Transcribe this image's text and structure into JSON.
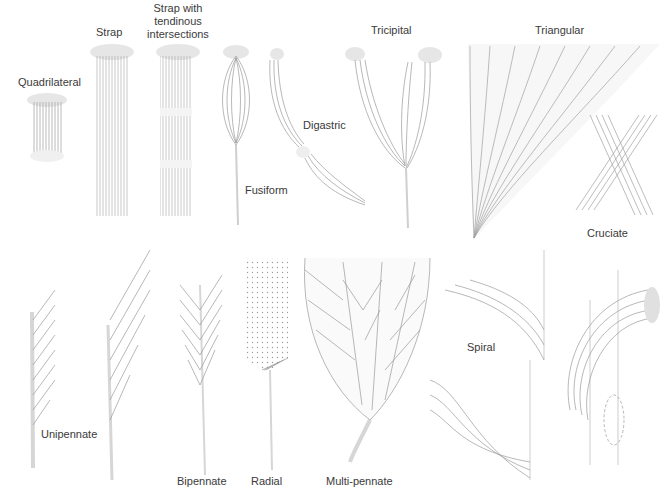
{
  "figure": {
    "colors": {
      "background": "#ffffff",
      "label_text": "#3a3a3a",
      "fiber_stroke": "#9a9a9a",
      "tendon_fill": "#e4e4e4"
    },
    "muscles": [
      {
        "id": "quadrilateral",
        "label": "Quadrilateral"
      },
      {
        "id": "strap",
        "label": "Strap"
      },
      {
        "id": "strap-tendinous",
        "label": "Strap with tendinous intersections"
      },
      {
        "id": "fusiform",
        "label": "Fusiform"
      },
      {
        "id": "digastric",
        "label": "Digastric"
      },
      {
        "id": "tricipital",
        "label": "Tricipital"
      },
      {
        "id": "triangular",
        "label": "Triangular"
      },
      {
        "id": "cruciate",
        "label": "Cruciate"
      },
      {
        "id": "unipennate",
        "label": "Unipennate"
      },
      {
        "id": "bipennate",
        "label": "Bipennate"
      },
      {
        "id": "radial",
        "label": "Radial"
      },
      {
        "id": "multi-pennate",
        "label": "Multi-pennate"
      },
      {
        "id": "spiral",
        "label": "Spiral"
      }
    ]
  }
}
